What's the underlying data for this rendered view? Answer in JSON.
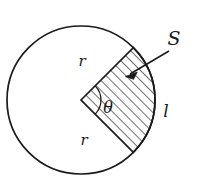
{
  "figure": {
    "type": "geometry-diagram",
    "background_color": "#ffffff",
    "stroke_color": "#1a1a1a",
    "circle": {
      "center_x": 81,
      "center_y": 100,
      "radius": 74,
      "stroke_width": 1.6
    },
    "sector": {
      "start_angle_deg": 45,
      "end_angle_deg": -45,
      "sweep_deg": 90,
      "hatched": true,
      "hatch_angle_deg": 45,
      "hatch_spacing_px": 7,
      "stroke_width": 1.6
    },
    "angle_arc": {
      "radius": 20,
      "stroke_width": 1.3
    },
    "pointer": {
      "from_x": 170,
      "from_y": 50,
      "to_x": 126,
      "to_y": 76,
      "arrowhead": true
    },
    "labels": {
      "radius_upper": {
        "text": "r",
        "x": 82,
        "y": 66
      },
      "radius_lower": {
        "text": "r",
        "x": 84,
        "y": 145
      },
      "angle": {
        "text": "θ",
        "x": 108,
        "y": 113
      },
      "area": {
        "text": "S",
        "x": 174,
        "y": 45
      },
      "arc_length": {
        "text": "l",
        "x": 166,
        "y": 117
      }
    }
  }
}
